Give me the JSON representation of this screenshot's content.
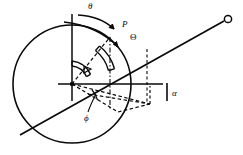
{
  "figure": {
    "type": "geometry-diagram",
    "background_color": "#ffffff",
    "stroke_color": "#0a0a0a",
    "labels": {
      "theta_small": "θ",
      "point_P": "P",
      "theta_capital": "Θ",
      "phi": "ϕ",
      "alpha": "α"
    },
    "elements": {
      "main_circle": {
        "name": "main-circle",
        "center_x": 72,
        "center_y": 84,
        "radius": 60
      },
      "center_point": {
        "name": "center-point",
        "x": 72,
        "y": 84
      },
      "vertical_axis": {
        "name": "vertical-reference-line",
        "x": 72,
        "y_top": 14,
        "y_bottom": 100
      },
      "horizontal_axis": {
        "name": "horizontal-reference-line",
        "x_left": 60,
        "x_right": 160,
        "y": 84
      },
      "long_ray": {
        "name": "long-ray-to-node",
        "from_x": 22,
        "from_y": 134,
        "to_x": 228,
        "to_y": 20
      },
      "node_circle": {
        "name": "node-circle-endpoint",
        "x": 228,
        "y": 20,
        "radius": 4
      },
      "radius_to_P": {
        "name": "radius-line-to-P",
        "from_x": 72,
        "from_y": 84,
        "to_x": 110,
        "to_y": 36
      },
      "angle_arcs": {
        "name": "angle-arc-band",
        "count": 2,
        "inner_radius": 18,
        "outer_radius": 45
      },
      "curved_arrow": {
        "name": "rotation-arrow-theta",
        "label": "θ"
      },
      "alpha_tick": {
        "name": "alpha-tick-mark",
        "x": 166,
        "y_top": 82,
        "y_bottom": 100
      },
      "dashed_construction": {
        "name": "dashed-construction-lines",
        "style": "dashed"
      }
    }
  }
}
